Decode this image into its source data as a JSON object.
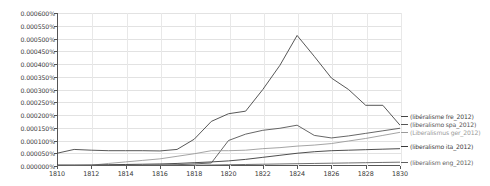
{
  "chart_data": {
    "type": "line",
    "title": "",
    "subtitle": "",
    "xlabel": "",
    "ylabel": "",
    "grid": true,
    "legend_position": "right",
    "xlim": [
      1810,
      1830
    ],
    "ylim": [
      0.0,
      0.0006
    ],
    "x_tick_labels": [
      "1810",
      "1812",
      "1814",
      "1816",
      "1818",
      "1820",
      "1822",
      "1824",
      "1826",
      "1828",
      "1830"
    ],
    "x_ticks": [
      1810,
      1812,
      1814,
      1816,
      1818,
      1820,
      1822,
      1824,
      1826,
      1828,
      1830
    ],
    "y_tick_labels": [
      "0.000600%",
      "0.000550%",
      "0.000500%",
      "0.000450%",
      "0.000400%",
      "0.000350%",
      "0.000300%",
      "0.000250%",
      "0.000200%",
      "0.000150%",
      "0.000100%",
      "0.000050%",
      "0.000000%"
    ],
    "y_ticks": [
      0.0006,
      0.00055,
      0.0005,
      0.00045,
      0.0004,
      0.00035,
      0.0003,
      0.00025,
      0.0002,
      0.00015,
      0.0001,
      5e-05,
      0.0
    ],
    "x": [
      1810,
      1811,
      1812,
      1813,
      1814,
      1815,
      1816,
      1817,
      1818,
      1819,
      1820,
      1821,
      1822,
      1823,
      1824,
      1825,
      1826,
      1827,
      1828,
      1829,
      1830
    ],
    "series": [
      {
        "name": "(libéralisme fre_2012)",
        "color": "#444444",
        "values": [
          5e-05,
          6.5e-05,
          6.2e-05,
          6e-05,
          6e-05,
          6e-05,
          5.9e-05,
          6.5e-05,
          0.000105,
          0.000175,
          0.000205,
          0.000215,
          0.0003,
          0.000395,
          0.000512,
          0.00043,
          0.000345,
          0.0003,
          0.000238,
          0.000238,
          0.00016
        ]
      },
      {
        "name": "(liberalismo spa_2012)",
        "color": "#555555",
        "values": [
          2e-06,
          2e-06,
          2e-06,
          3e-06,
          3e-06,
          3e-06,
          4e-06,
          5e-06,
          8e-06,
          1.2e-05,
          0.0001,
          0.000125,
          0.00014,
          0.000148,
          0.00016,
          0.00012,
          0.00011,
          0.000118,
          0.000128,
          0.000138,
          0.000148
        ]
      },
      {
        "name": "(Liberalismus ger_2012)",
        "color": "#9a9a9a",
        "values": [
          0.0,
          2e-06,
          3e-06,
          1e-05,
          1.6e-05,
          2.2e-05,
          2.8e-05,
          3.8e-05,
          4.8e-05,
          6e-05,
          6e-05,
          6.2e-05,
          6.8e-05,
          7.2e-05,
          7.8e-05,
          8.2e-05,
          8.8e-05,
          9.8e-05,
          0.000108,
          0.00012,
          0.000132
        ]
      },
      {
        "name": "(liberalismo ita_2012)",
        "color": "#3a3a3a",
        "values": [
          4e-06,
          4e-06,
          4e-06,
          5e-06,
          6e-06,
          7e-06,
          8e-06,
          1e-05,
          1.3e-05,
          1.6e-05,
          2e-05,
          2.6e-05,
          3.4e-05,
          4.2e-05,
          5e-05,
          5.6e-05,
          6e-05,
          6.2e-05,
          6.4e-05,
          6.6e-05,
          6.8e-05
        ]
      },
      {
        "name": "(liberalism eng_2012)",
        "color": "#606060",
        "values": [
          1e-06,
          1e-06,
          1e-06,
          1e-06,
          2e-06,
          2e-06,
          2e-06,
          3e-06,
          3e-06,
          4e-06,
          5e-06,
          6e-06,
          7e-06,
          8e-06,
          9e-06,
          1e-05,
          1.1e-05,
          1.2e-05,
          1.3e-05,
          1.4e-05,
          1.5e-05
        ]
      }
    ],
    "legend_entries": [
      {
        "label": "(libéralisme fre_2012)",
        "color": "#444444",
        "y": 113
      },
      {
        "label": "(liberalismo spa_2012)",
        "color": "#555555",
        "y": 121
      },
      {
        "label": "(Liberalismus ger_2012)",
        "color": "#9a9a9a",
        "y": 129
      },
      {
        "label": "(liberalismo ita_2012)",
        "color": "#3a3a3a",
        "y": 143
      },
      {
        "label": "(liberalism eng_2012)",
        "color": "#606060",
        "y": 159
      }
    ]
  }
}
